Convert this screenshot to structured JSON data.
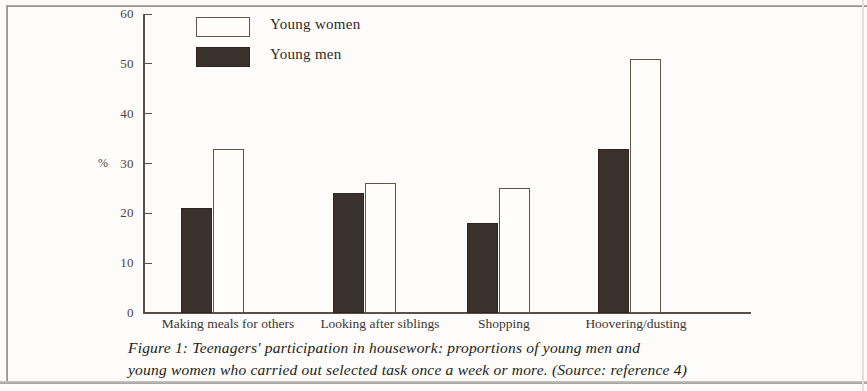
{
  "figure": {
    "caption_line1": "Figure 1: Teenagers' participation in housework: proportions of young men and",
    "caption_line2": "young women who carried out selected task once a week or more.  (Source: reference 4)"
  },
  "chart_data": {
    "type": "bar",
    "title": "",
    "xlabel": "",
    "ylabel": "%",
    "ylim": [
      0,
      60
    ],
    "yticks": [
      0,
      10,
      20,
      30,
      40,
      50,
      60
    ],
    "grid": false,
    "legend_position": "top-left inside plot area",
    "categories": [
      "Making meals for others",
      "Looking after siblings",
      "Shopping",
      "Hoovering/dusting"
    ],
    "series": [
      {
        "name": "Young men",
        "color": "#3a302c",
        "values": [
          21,
          24,
          18,
          33
        ]
      },
      {
        "name": "Young women",
        "color": "#fffefb",
        "values": [
          33,
          26,
          25,
          51
        ]
      }
    ]
  },
  "legend": {
    "items": [
      {
        "label": "Young women",
        "style": "women"
      },
      {
        "label": "Young men",
        "style": "men"
      }
    ]
  }
}
